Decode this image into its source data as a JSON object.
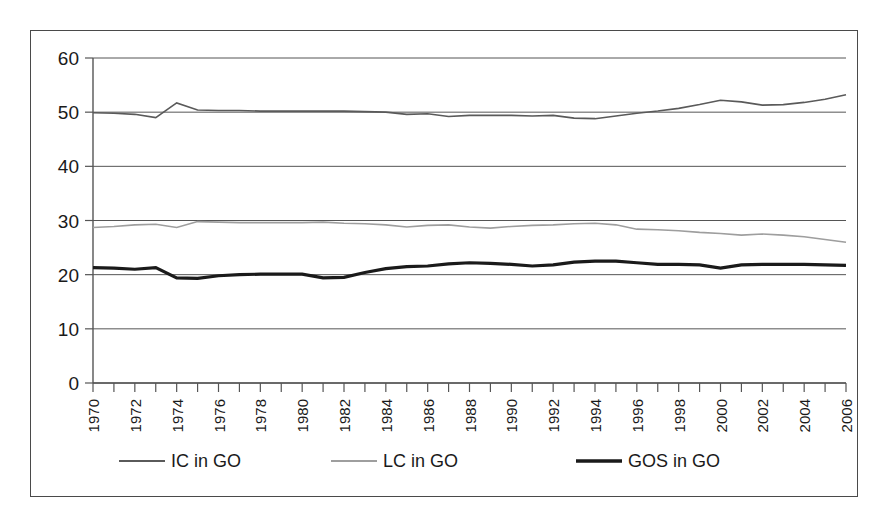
{
  "chart_data": {
    "type": "line",
    "title": "",
    "subtitle": "",
    "xlabel": "",
    "ylabel": "",
    "xlim": [
      1970,
      2006
    ],
    "ylim": [
      0,
      60
    ],
    "yticks": [
      0,
      10,
      20,
      30,
      40,
      50,
      60
    ],
    "grid": true,
    "legend_position": "bottom",
    "x": [
      1970,
      1971,
      1972,
      1973,
      1974,
      1975,
      1976,
      1977,
      1978,
      1979,
      1980,
      1981,
      1982,
      1983,
      1984,
      1985,
      1986,
      1987,
      1988,
      1989,
      1990,
      1991,
      1992,
      1993,
      1994,
      1995,
      1996,
      1997,
      1998,
      1999,
      2000,
      2001,
      2002,
      2003,
      2004,
      2005,
      2006
    ],
    "xtick_labels": [
      "1970",
      "1972",
      "1974",
      "1976",
      "1978",
      "1980",
      "1982",
      "1984",
      "1986",
      "1988",
      "1990",
      "1992",
      "1994",
      "1996",
      "1998",
      "2000",
      "2002",
      "2004",
      "2006"
    ],
    "series": [
      {
        "name": "IC in GO",
        "color": "#5a5a5a",
        "width": 1.6,
        "values": [
          49.9,
          49.8,
          49.6,
          49.0,
          51.7,
          50.4,
          50.3,
          50.3,
          50.2,
          50.2,
          50.2,
          50.2,
          50.2,
          50.1,
          50.0,
          49.6,
          49.7,
          49.2,
          49.4,
          49.4,
          49.4,
          49.3,
          49.4,
          48.9,
          48.8,
          49.3,
          49.8,
          50.2,
          50.7,
          51.4,
          52.2,
          51.9,
          51.3,
          51.4,
          51.8,
          52.4,
          53.2
        ]
      },
      {
        "name": "LC in GO",
        "color": "#9e9e9e",
        "width": 1.6,
        "values": [
          28.7,
          28.9,
          29.2,
          29.3,
          28.7,
          29.8,
          29.7,
          29.6,
          29.6,
          29.6,
          29.6,
          29.7,
          29.5,
          29.4,
          29.2,
          28.8,
          29.1,
          29.2,
          28.8,
          28.6,
          28.9,
          29.1,
          29.2,
          29.4,
          29.5,
          29.2,
          28.4,
          28.3,
          28.1,
          27.8,
          27.6,
          27.3,
          27.5,
          27.3,
          27.0,
          26.5,
          26.0
        ]
      },
      {
        "name": "GOS in GO",
        "color": "#1a1a1a",
        "width": 3.2,
        "values": [
          21.3,
          21.2,
          21.0,
          21.3,
          19.4,
          19.3,
          19.8,
          20.0,
          20.1,
          20.1,
          20.1,
          19.4,
          19.5,
          20.4,
          21.1,
          21.5,
          21.6,
          22.0,
          22.2,
          22.1,
          21.9,
          21.6,
          21.8,
          22.3,
          22.5,
          22.5,
          22.2,
          21.9,
          21.9,
          21.8,
          21.2,
          21.8,
          21.9,
          21.9,
          21.9,
          21.8,
          21.7
        ]
      }
    ],
    "legend": [
      {
        "label": "IC in GO",
        "color": "#5a5a5a",
        "width": 1.8
      },
      {
        "label": "LC in GO",
        "color": "#9e9e9e",
        "width": 1.8
      },
      {
        "label": "GOS in GO",
        "color": "#1a1a1a",
        "width": 3.4
      }
    ]
  }
}
